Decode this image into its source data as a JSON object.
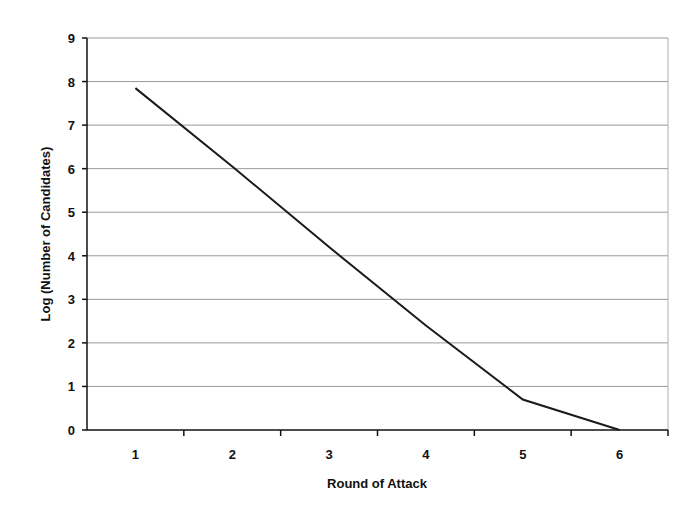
{
  "chart_data": {
    "type": "line",
    "title": "",
    "xlabel": "Round of Attack",
    "ylabel": "Log (Number of Candidates)",
    "categories": [
      "1",
      "2",
      "3",
      "4",
      "5",
      "6"
    ],
    "series": [
      {
        "name": "Log (Number of Candidates)",
        "values": [
          7.85,
          6.05,
          4.2,
          2.4,
          0.7,
          0.0
        ]
      }
    ],
    "ylim": [
      0,
      9
    ],
    "yticks": [
      0,
      1,
      2,
      3,
      4,
      5,
      6,
      7,
      8,
      9
    ],
    "grid": true,
    "legend": "none",
    "line_color": "#1a1a1a",
    "grid_color": "#9a9a9a"
  }
}
